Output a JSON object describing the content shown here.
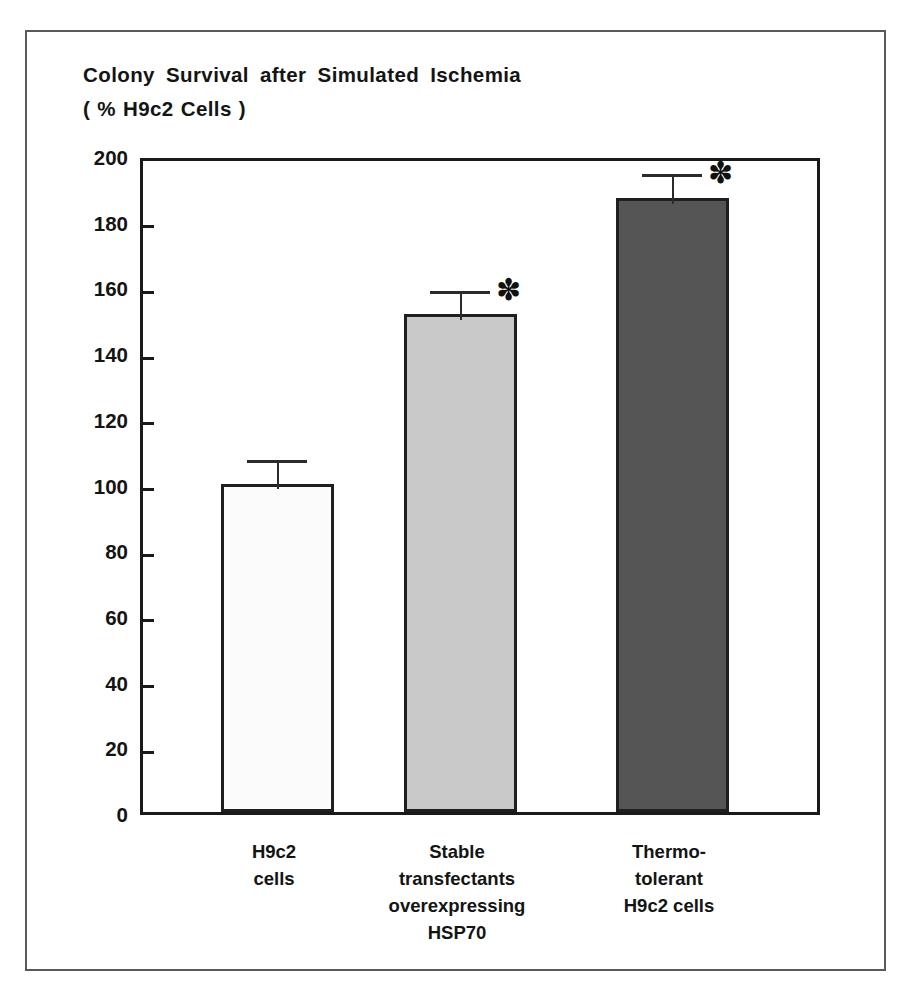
{
  "figure": {
    "title_line1": "Colony Survival after Simulated Ischemia",
    "title_line2": "( % H9c2 Cells )"
  },
  "chart_data": {
    "type": "bar",
    "title": "Colony Survival after Simulated Ischemia ( % H9c2 Cells )",
    "xlabel": "",
    "ylabel": "Colony Survival after Simulated Ischemia ( % H9c2 Cells )",
    "ylim": [
      0,
      200
    ],
    "yticks": [
      0,
      20,
      40,
      60,
      80,
      100,
      120,
      140,
      160,
      180,
      200
    ],
    "ytick_labels": [
      "0",
      "20",
      "40",
      "60",
      "80",
      "100",
      "120",
      "140",
      "160",
      "180",
      "200"
    ],
    "grid": false,
    "legend": "none",
    "categories": [
      "H9c2\ncells",
      "Stable\ntransfectants\noverexpressing\nHSP70",
      "Thermo-\ntolerant\nH9c2 cells"
    ],
    "values": [
      100,
      151.5,
      187
    ],
    "errors": [
      9,
      9,
      9
    ],
    "annotations": [
      "",
      "*",
      "*"
    ],
    "bar_colors": [
      "#fbfbfb",
      "#c9c9c9",
      "#555555"
    ],
    "bar_edge_color": "#1f1f1f",
    "axis_color": "#1a1a1a",
    "significance_symbol": "✽"
  }
}
